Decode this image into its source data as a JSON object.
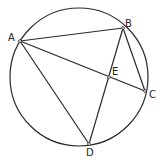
{
  "diagram": {
    "type": "cyclic-quadrilateral",
    "circle": {
      "cx": 79,
      "cy": 77,
      "r": 69
    },
    "points": [
      {
        "label": "A",
        "x": 20,
        "y": 41,
        "lx": 8,
        "ly": 33
      },
      {
        "label": "B",
        "x": 123,
        "y": 28,
        "lx": 125,
        "ly": 19
      },
      {
        "label": "C",
        "x": 145,
        "y": 91,
        "lx": 149,
        "ly": 90
      },
      {
        "label": "D",
        "x": 89,
        "y": 144,
        "lx": 86,
        "ly": 148
      },
      {
        "label": "E",
        "x": 109,
        "y": 77,
        "lx": 112,
        "ly": 67
      }
    ],
    "segments": [
      [
        "A",
        "B"
      ],
      [
        "B",
        "C"
      ],
      [
        "A",
        "C"
      ],
      [
        "A",
        "D"
      ],
      [
        "B",
        "D"
      ]
    ],
    "stroke_color": "#2a2a2a"
  }
}
